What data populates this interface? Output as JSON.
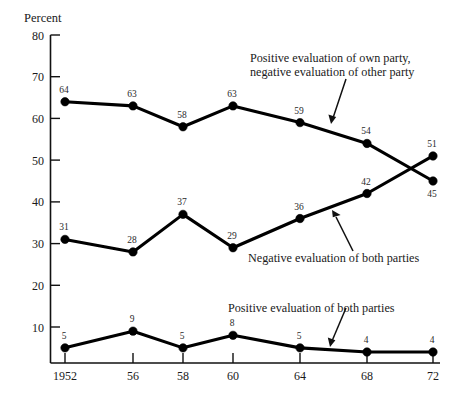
{
  "chart_data": {
    "type": "line",
    "title": "",
    "subtitle": "",
    "xlabel": "",
    "ylabel": "Percent",
    "x": [
      1952,
      1956,
      1958,
      1960,
      1964,
      1968,
      1972
    ],
    "categories": [
      "1952",
      "56",
      "58",
      "60",
      "64",
      "68",
      "72"
    ],
    "xtick_labels": [
      "1952",
      "56",
      "58",
      "60",
      "64",
      "68",
      "72"
    ],
    "ytick_labels": [
      "80",
      "70",
      "60",
      "50",
      "40",
      "30",
      "20",
      "10"
    ],
    "yticks": [
      80,
      70,
      60,
      50,
      40,
      30,
      20,
      10
    ],
    "ylim": [
      0,
      80
    ],
    "grid": false,
    "legend_position": "inline-annotations",
    "series": [
      {
        "name": "Positive evaluation of own party, negative evaluation of other party",
        "values": [
          64,
          63,
          58,
          63,
          59,
          54,
          45
        ],
        "color": "#000000",
        "marker": "filled-circle",
        "label_offsets": [
          "above",
          "above",
          "above",
          "above",
          "above",
          "above",
          "below"
        ]
      },
      {
        "name": "Negative evaluation of both parties",
        "values": [
          31,
          28,
          37,
          29,
          36,
          42,
          51
        ],
        "color": "#000000",
        "marker": "filled-circle",
        "label_offsets": [
          "above",
          "above",
          "above",
          "above",
          "above",
          "above",
          "above"
        ]
      },
      {
        "name": "Positive evaluation of both parties",
        "values": [
          5,
          9,
          5,
          8,
          5,
          4,
          4
        ],
        "color": "#000000",
        "marker": "filled-circle",
        "label_offsets": [
          "above",
          "above",
          "above",
          "above",
          "above",
          "above",
          "above"
        ]
      }
    ],
    "annotations": [
      {
        "id": "annotation-own-party",
        "lines": [
          "Positive evaluation of own party,",
          "negative evaluation of other party"
        ],
        "arrow_from": [
          346,
          77
        ],
        "arrow_to": [
          331,
          123
        ]
      },
      {
        "id": "annotation-negative-both",
        "lines": [
          "Negative evaluation of both parties"
        ],
        "arrow_from": [
          353,
          251
        ],
        "arrow_to": [
          332,
          211
        ]
      },
      {
        "id": "annotation-positive-both",
        "lines": [
          "Positive evaluation of both parties"
        ],
        "arrow_from": [
          346,
          307
        ],
        "arrow_to": [
          330,
          346
        ]
      }
    ],
    "point_labels": {
      "series1": [
        "64",
        "63",
        "58",
        "63",
        "59",
        "54",
        "45"
      ],
      "series2": [
        "31",
        "28",
        "37",
        "29",
        "36",
        "42",
        "51"
      ],
      "series3": [
        "5",
        "9",
        "5",
        "8",
        "5",
        "4",
        "4"
      ]
    }
  },
  "axis": {
    "y_axis_title": "Percent"
  }
}
